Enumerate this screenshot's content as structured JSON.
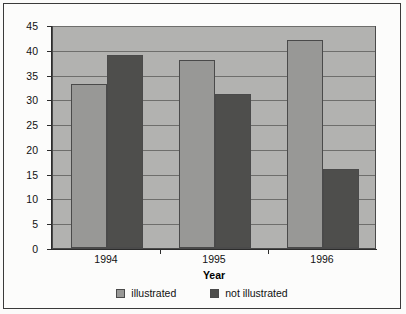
{
  "chart_data": {
    "type": "bar",
    "title": "",
    "subtitle": "",
    "xlabel": "Year",
    "ylabel": "Number",
    "categories": [
      "1994",
      "1995",
      "1996"
    ],
    "series": [
      {
        "name": "illustrated",
        "values": [
          33,
          38,
          42
        ],
        "color": "#989896"
      },
      {
        "name": "not illustrated",
        "values": [
          39,
          31,
          16
        ],
        "color": "#4e4e4c"
      }
    ],
    "ylim": [
      0,
      45
    ],
    "ytick_step": 5,
    "yticks": [
      0,
      5,
      10,
      15,
      20,
      25,
      30,
      35,
      40,
      45
    ],
    "ytick_labels": [
      "0",
      "5",
      "10",
      "15",
      "20",
      "25",
      "30",
      "35",
      "40",
      "45"
    ],
    "grid": true,
    "grid_axis": "y",
    "legend_position": "bottom",
    "plot_background": "#b2b2b0",
    "frame_color": "#3a3a3a",
    "grouped": true
  }
}
